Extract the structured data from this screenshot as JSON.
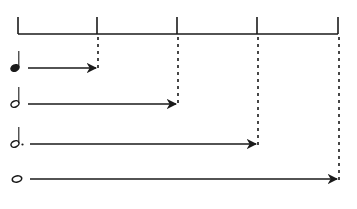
{
  "diagram": {
    "stroke_color": "#1a1a1a",
    "timeline": {
      "y": 34,
      "tick_top": 17,
      "ticks_x": [
        18,
        97,
        177,
        257,
        338
      ],
      "beat_count": 4
    },
    "notes": [
      {
        "name": "quarter-note",
        "label": "Quarter note",
        "beats": 1,
        "y": 68,
        "head_x": 15,
        "filled": true,
        "stem": true,
        "dotted": false,
        "arrow_start_x": 28,
        "arrow_end_x": 97
      },
      {
        "name": "half-note",
        "label": "Half note",
        "beats": 2,
        "y": 104,
        "head_x": 15,
        "filled": false,
        "stem": true,
        "dotted": false,
        "arrow_start_x": 28,
        "arrow_end_x": 177
      },
      {
        "name": "dotted-half-note",
        "label": "Dotted half note",
        "beats": 3,
        "y": 144,
        "head_x": 15,
        "filled": false,
        "stem": true,
        "dotted": true,
        "arrow_start_x": 30,
        "arrow_end_x": 257
      },
      {
        "name": "whole-note",
        "label": "Whole note",
        "beats": 4,
        "y": 179,
        "head_x": 17,
        "filled": false,
        "stem": false,
        "dotted": false,
        "arrow_start_x": 30,
        "arrow_end_x": 338
      }
    ]
  }
}
